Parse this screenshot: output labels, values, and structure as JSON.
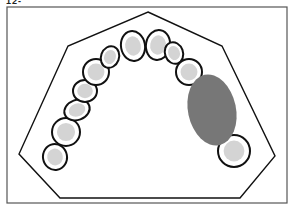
{
  "figure": {
    "label": "12-",
    "colors": {
      "outline": "#111111",
      "tooth_fill": "#ffffff",
      "tooth_shade": "#d4d4d4",
      "edentulous_area": "#777777",
      "background": "#ffffff"
    },
    "teeth": [
      {
        "id": "t1",
        "cx": 55,
        "cy": 157,
        "rx": 12,
        "ry": 13,
        "rot": -10
      },
      {
        "id": "t2",
        "cx": 66,
        "cy": 132,
        "rx": 14,
        "ry": 14,
        "rot": 0
      },
      {
        "id": "t3",
        "cx": 77,
        "cy": 110,
        "rx": 13,
        "ry": 10,
        "rot": -20
      },
      {
        "id": "t4",
        "cx": 85,
        "cy": 91,
        "rx": 12,
        "ry": 11,
        "rot": 0
      },
      {
        "id": "t5",
        "cx": 96,
        "cy": 72,
        "rx": 13,
        "ry": 13,
        "rot": 0
      },
      {
        "id": "t6",
        "cx": 110,
        "cy": 57,
        "rx": 9,
        "ry": 11,
        "rot": 20
      },
      {
        "id": "t7",
        "cx": 133,
        "cy": 46,
        "rx": 12,
        "ry": 15,
        "rot": -10
      },
      {
        "id": "t8",
        "cx": 158,
        "cy": 45,
        "rx": 12,
        "ry": 15,
        "rot": 10
      },
      {
        "id": "t9",
        "cx": 174,
        "cy": 53,
        "rx": 9,
        "ry": 11,
        "rot": -20
      },
      {
        "id": "t10",
        "cx": 189,
        "cy": 72,
        "rx": 13,
        "ry": 13,
        "rot": 0
      },
      {
        "id": "t11",
        "cx": 234,
        "cy": 151,
        "rx": 16,
        "ry": 16,
        "rot": 0
      }
    ],
    "gap": {
      "cx": 212,
      "cy": 110,
      "rx": 24,
      "ry": 36,
      "rot": -12
    }
  }
}
